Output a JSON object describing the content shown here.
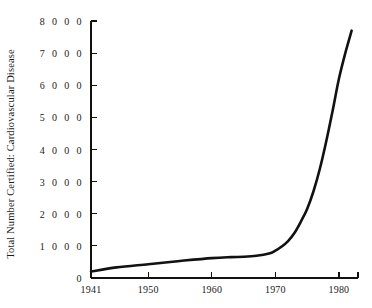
{
  "chart_data": {
    "type": "line",
    "title": "",
    "subtitle": "",
    "xlabel": "",
    "ylabel": "Total Number Certified: Cardiovascular Disease",
    "xlim": [
      1941,
      1983
    ],
    "ylim": [
      0,
      8000
    ],
    "grid": false,
    "legend": null,
    "xticks": [
      1941,
      1950,
      1960,
      1970,
      1980
    ],
    "xtick_labels": [
      "1941",
      "1950",
      "1960",
      "1970",
      "1980"
    ],
    "yticks": [
      0,
      1000,
      2000,
      3000,
      4000,
      5000,
      6000,
      7000,
      8000
    ],
    "ytick_labels": [
      "0",
      "1 0 0 0",
      "2 0 0 0",
      "3 0 0 0",
      "4 0 0 0",
      "5 0 0 0",
      "6 0 0 0",
      "7 0 0 0",
      "8 0 0 0"
    ],
    "line_color": "#111111",
    "line_width": 2.6,
    "background_color": "#ffffff",
    "series": [
      {
        "name": "Total Number Certified: Cardiovascular Disease",
        "x": [
          1941,
          1945,
          1950,
          1955,
          1960,
          1963,
          1965,
          1967,
          1969,
          1970,
          1971,
          1972,
          1973,
          1974,
          1975,
          1976,
          1977,
          1978,
          1979,
          1980,
          1981,
          1982
        ],
        "values": [
          200,
          330,
          430,
          530,
          620,
          650,
          660,
          690,
          760,
          850,
          980,
          1150,
          1400,
          1750,
          2150,
          2700,
          3400,
          4250,
          5200,
          6200,
          7000,
          7700
        ]
      }
    ]
  },
  "axes": {
    "x_axis_name": "year-axis",
    "y_axis_name": "count-axis"
  }
}
